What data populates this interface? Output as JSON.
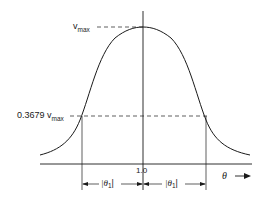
{
  "diagram": {
    "type": "gaussian-curve",
    "labels": {
      "vmax_main": "v",
      "vmax_sub": "max",
      "level_coeff": "0.3679 v",
      "level_sub": "max",
      "center_tick": "1.0",
      "x_axis": "θ",
      "left_width": "|θ",
      "left_width_sub": "1",
      "left_width_close": "|",
      "right_width": "|θ",
      "right_width_sub": "1",
      "right_width_close": "|"
    },
    "colors": {
      "line": "#1a1a1a",
      "background": "#ffffff"
    }
  }
}
